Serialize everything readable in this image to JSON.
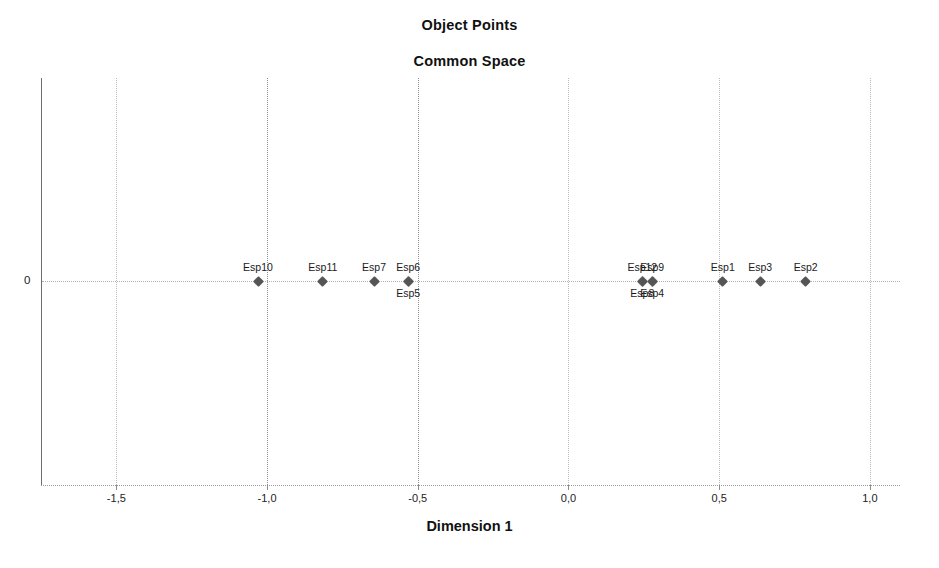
{
  "chart_data": {
    "type": "scatter",
    "title": "Object Points",
    "subtitle": "Common Space",
    "xlabel": "Dimension 1",
    "ylabel": "",
    "xlim": [
      -1.75,
      1.1
    ],
    "ylim": [
      -1.0,
      1.0
    ],
    "grid": true,
    "legend": "none",
    "x_tick_labels": [
      "-1,5",
      "-1,0",
      "-0,5",
      "0,0",
      "0,5",
      "1,0"
    ],
    "x_tick_values": [
      -1.5,
      -1.0,
      -0.5,
      0.0,
      0.5,
      1.0
    ],
    "y_tick_labels": [
      "0"
    ],
    "y_tick_values": [
      0
    ],
    "points": [
      {
        "label": "Esp10",
        "x": -1.03,
        "y": 0,
        "label_pos": "above"
      },
      {
        "label": "Esp11",
        "x": -0.815,
        "y": 0,
        "label_pos": "above"
      },
      {
        "label": "Esp7",
        "x": -0.645,
        "y": 0,
        "label_pos": "above"
      },
      {
        "label": "Esp6",
        "x": -0.532,
        "y": 0,
        "label_pos": "above"
      },
      {
        "label": "Esp5",
        "x": -0.532,
        "y": 0,
        "label_pos": "below"
      },
      {
        "label": "Esp12",
        "x": 0.245,
        "y": 0,
        "label_pos": "above"
      },
      {
        "label": "Esp8",
        "x": 0.245,
        "y": 0,
        "label_pos": "below"
      },
      {
        "label": "Esp9",
        "x": 0.278,
        "y": 0,
        "label_pos": "above"
      },
      {
        "label": "Esp4",
        "x": 0.278,
        "y": 0,
        "label_pos": "below"
      },
      {
        "label": "Esp1",
        "x": 0.512,
        "y": 0,
        "label_pos": "above"
      },
      {
        "label": "Esp3",
        "x": 0.636,
        "y": 0,
        "label_pos": "above"
      },
      {
        "label": "Esp2",
        "x": 0.787,
        "y": 0,
        "label_pos": "above"
      }
    ],
    "marker_color": "#555555",
    "gridline_color": "#b9b9b9",
    "axis_color": "#6f6f6f"
  }
}
